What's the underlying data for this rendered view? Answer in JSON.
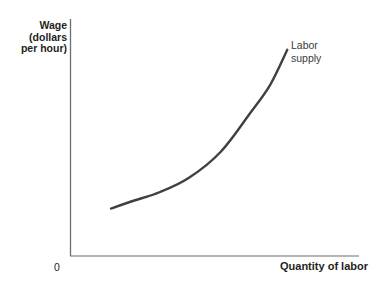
{
  "figure": {
    "background": "#ffffff",
    "axis_color": "#6e6e6e",
    "curve_color": "#3f4042",
    "text_color": "#231f20"
  },
  "labels": {
    "y_axis_lines": [
      "Wage",
      "(dollars",
      "per hour)"
    ],
    "origin": "0",
    "x_axis": "Quantity of labor",
    "curve_lines": [
      "Labor",
      "supply"
    ]
  },
  "chart_data": {
    "type": "line",
    "title": "",
    "xlabel": "Quantity of labor",
    "ylabel": "Wage (dollars per hour)",
    "xlim": [
      0,
      10
    ],
    "ylim": [
      0,
      10
    ],
    "grid": false,
    "x_tick_labels": [
      "0"
    ],
    "y_tick_labels": [],
    "legend_position": "annotation-at-curve-end",
    "series": [
      {
        "name": "Labor supply",
        "x": [
          1.4,
          2.1,
          3.1,
          4.1,
          5.2,
          6.2,
          6.9,
          7.5
        ],
        "y": [
          2.0,
          2.3,
          2.7,
          3.3,
          4.4,
          6.0,
          7.2,
          8.7
        ]
      }
    ]
  }
}
